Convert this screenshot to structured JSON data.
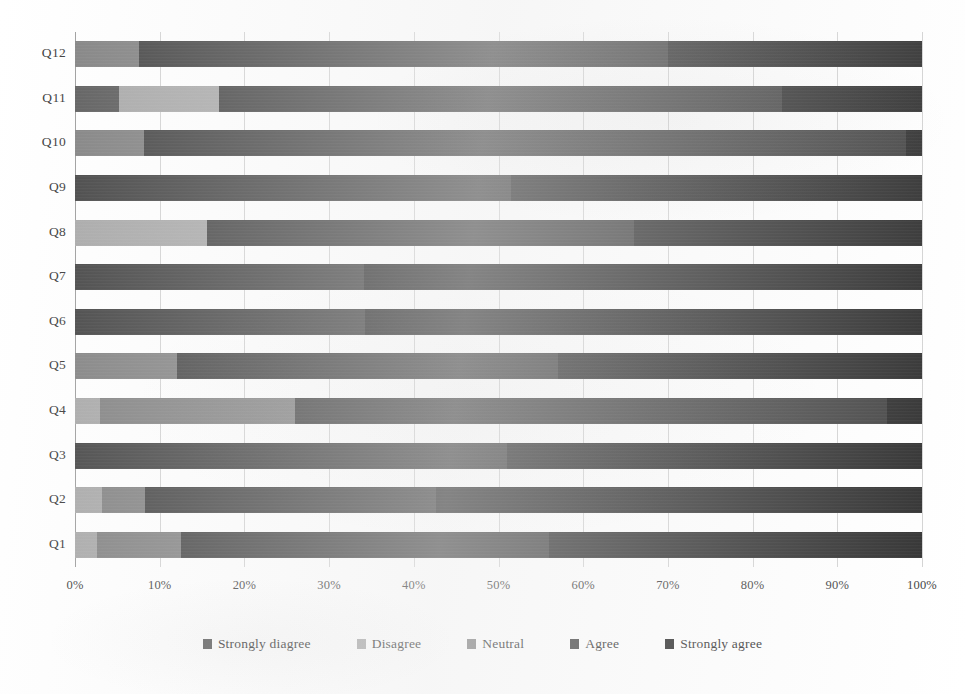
{
  "chart_data": {
    "type": "bar",
    "subtype": "stacked-horizontal-100-percent",
    "title": "",
    "xlabel": "",
    "ylabel": "",
    "orientation": "horizontal",
    "stacked": true,
    "grid": true,
    "legend_position": "bottom",
    "xlim": [
      0,
      100
    ],
    "x_tick_labels": [
      "0%",
      "10%",
      "20%",
      "30%",
      "40%",
      "50%",
      "60%",
      "70%",
      "80%",
      "90%",
      "100%"
    ],
    "x_tick_values": [
      0,
      10,
      20,
      30,
      40,
      50,
      60,
      70,
      80,
      90,
      100
    ],
    "categories": [
      "Q1",
      "Q2",
      "Q3",
      "Q4",
      "Q5",
      "Q6",
      "Q7",
      "Q8",
      "Q9",
      "Q10",
      "Q11",
      "Q12"
    ],
    "category_order_top_to_bottom": [
      "Q12",
      "Q11",
      "Q10",
      "Q9",
      "Q8",
      "Q7",
      "Q6",
      "Q5",
      "Q4",
      "Q3",
      "Q2",
      "Q1"
    ],
    "series": [
      {
        "name": "Strongly diagree",
        "color": "#595959",
        "values": [
          0,
          0,
          0,
          0,
          0,
          0,
          0,
          0,
          0,
          0,
          5.2,
          0
        ]
      },
      {
        "name": "Disagree",
        "color": "#a6a6a6",
        "values": [
          2.6,
          3.2,
          0,
          3.0,
          0,
          0,
          0,
          15.6,
          0,
          0,
          11.8,
          0
        ]
      },
      {
        "name": "Neutral",
        "color": "#7f7f7f",
        "values": [
          9.9,
          5.1,
          0,
          23.0,
          12.0,
          0,
          0,
          0,
          0,
          8.1,
          0,
          7.6
        ]
      },
      {
        "name": "Agree",
        "color": "#404040",
        "values": [
          43.5,
          34.3,
          51.0,
          69.9,
          45.0,
          34.2,
          34.1,
          50.4,
          51.5,
          90.0,
          66.5,
          62.4
        ]
      },
      {
        "name": "Strongly agree",
        "color": "#2b2b2b",
        "values": [
          44.0,
          57.4,
          49.0,
          4.1,
          43.0,
          65.8,
          65.9,
          34.0,
          48.5,
          1.9,
          16.5,
          30.0
        ]
      }
    ]
  },
  "legend": {
    "items": [
      {
        "label": "Strongly diagree",
        "color": "#595959"
      },
      {
        "label": "Disagree",
        "color": "#a6a6a6"
      },
      {
        "label": "Neutral",
        "color": "#7f7f7f"
      },
      {
        "label": "Agree",
        "color": "#404040"
      },
      {
        "label": "Strongly agree",
        "color": "#2b2b2b"
      }
    ]
  },
  "page_artifacts": {
    "bleed_text_top": "",
    "bleed_text_mid": "",
    "bleed_text_right": ""
  }
}
